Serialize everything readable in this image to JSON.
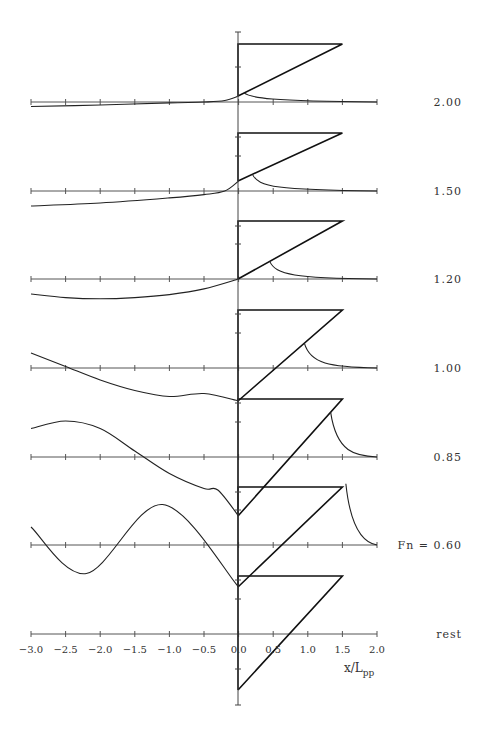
{
  "chart_data": {
    "type": "line",
    "title": "",
    "xlabel": "x/L_pp",
    "ylabel": "",
    "xlim": [
      -3.0,
      2.0
    ],
    "x_ticks": [
      "-3.0",
      "-2.5",
      "-2.0",
      "-1.5",
      "-1.0",
      "-0.5",
      "0.0",
      "0.5",
      "1.0",
      "1.5",
      "2.0"
    ],
    "grid": false,
    "legend": "none",
    "panels": [
      {
        "label": "2.00",
        "fn": 2.0
      },
      {
        "label": "1.50",
        "fn": 1.5
      },
      {
        "label": "1.20",
        "fn": 1.2
      },
      {
        "label": "1.00",
        "fn": 1.0
      },
      {
        "label": "0.85",
        "fn": 0.85
      },
      {
        "label": "Fn = 0.60",
        "fn": 0.6
      },
      {
        "label": "rest",
        "fn": 0
      }
    ],
    "series": [
      {
        "name": "2.00",
        "x": [
          -3.0,
          -2.0,
          -1.0,
          -0.5,
          -0.2,
          0.0
        ],
        "y": [
          -0.15,
          -0.1,
          -0.03,
          0.0,
          0.05,
          0.12
        ]
      },
      {
        "name": "1.50",
        "x": [
          -3.0,
          -2.0,
          -1.0,
          -0.5,
          -0.2,
          0.0
        ],
        "y": [
          -0.5,
          -0.4,
          -0.23,
          -0.12,
          0.0,
          0.14
        ]
      },
      {
        "name": "1.20",
        "x": [
          -3.0,
          -2.5,
          -2.0,
          -1.5,
          -1.0,
          -0.5,
          0.0
        ],
        "y": [
          -0.5,
          -0.62,
          -0.66,
          -0.62,
          -0.52,
          -0.33,
          0.0
        ]
      },
      {
        "name": "1.00",
        "x": [
          -3.0,
          -2.5,
          -2.0,
          -1.5,
          -1.0,
          -0.5,
          0.0
        ],
        "y": [
          0.5,
          0.05,
          -0.4,
          -0.75,
          -0.95,
          -0.85,
          -0.6
        ]
      },
      {
        "name": "0.85",
        "x": [
          -3.0,
          -2.5,
          -2.0,
          -1.5,
          -1.0,
          -0.5,
          -0.3,
          0.0
        ],
        "y": [
          0.95,
          1.2,
          0.95,
          0.2,
          -0.55,
          -1.05,
          -1.1,
          -1.0
        ]
      },
      {
        "name": "Fn = 0.60",
        "x": [
          -3.0,
          -2.2,
          -1.1,
          0.0
        ],
        "y": [
          0.6,
          -0.95,
          1.35,
          -0.6
        ]
      },
      {
        "name": "rest",
        "x": [
          0.0
        ],
        "y": [
          0.0
        ]
      }
    ],
    "annotations": [
      "Fn = 0.60",
      "rest"
    ]
  },
  "labels": {
    "xlabel_main": "x/L",
    "xlabel_sub": "pp"
  }
}
